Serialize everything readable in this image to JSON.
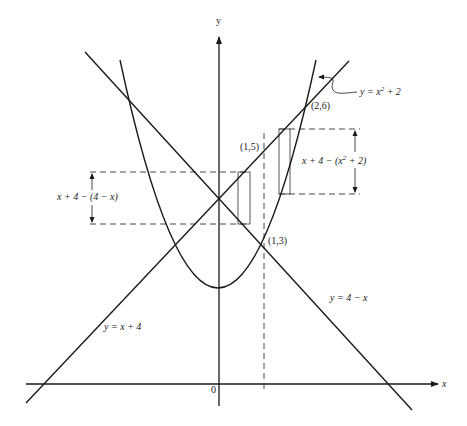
{
  "diagram": {
    "type": "area between curves",
    "axes": {
      "x_label": "x",
      "y_label": "y",
      "origin_label": "0"
    },
    "curves": [
      {
        "name": "parabola",
        "label": "y = x² + 2"
      },
      {
        "name": "line-increasing",
        "label": "y = x + 4"
      },
      {
        "name": "line-decreasing",
        "label": "y = 4 − x"
      }
    ],
    "points": [
      {
        "label": "(1,5)"
      },
      {
        "label": "(1,3)"
      },
      {
        "label": "(2,6)"
      }
    ],
    "strips": [
      {
        "name": "left-strip",
        "height_label": "x + 4 − (4 − x)"
      },
      {
        "name": "right-strip",
        "height_label": "x + 4 − (x² + 2)"
      }
    ],
    "divider": "x = 1 (dashed)"
  },
  "labels": {
    "y_axis": "y",
    "x_axis": "x",
    "origin": "0",
    "parabola_prefix": "y = x",
    "parabola_exp": "2",
    "parabola_suffix": " + 2",
    "line_inc": "y = x + 4",
    "line_dec": "y = 4 − x",
    "pt_1_5": "(1,5)",
    "pt_1_3": "(1,3)",
    "pt_2_6": "(2,6)",
    "left_strip_label": "x + 4 − (4 − x)",
    "right_strip_prefix": "x + 4 − (x",
    "right_strip_exp": "2",
    "right_strip_suffix": " + 2)"
  }
}
